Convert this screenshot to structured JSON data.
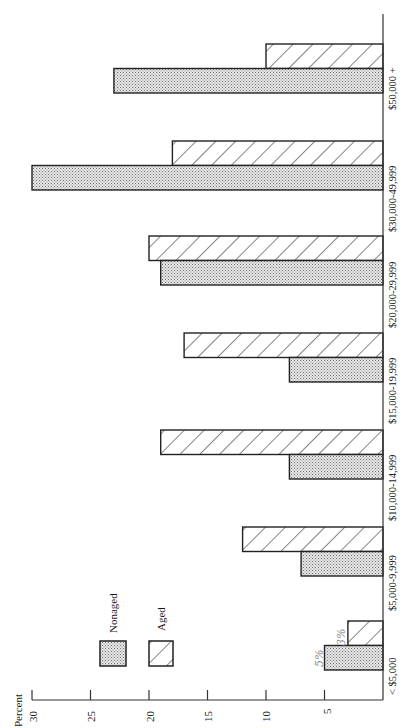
{
  "chart_data": {
    "type": "bar",
    "orientation": "rotated page; bars extend leftward from baseline (horizontal value axis at bottom)",
    "title": "",
    "xlabel": "",
    "ylabel": "Percent",
    "ylim": [
      0,
      30
    ],
    "yticks": [
      5,
      10,
      15,
      20,
      25,
      30
    ],
    "grid": false,
    "legend_position": "lower-left (rotated)",
    "categories": [
      "< $5,000",
      "$5,000-9,999",
      "$10,000-14,999",
      "$15,000-19,999",
      "$20,000-29,999",
      "$30,000-49,999",
      "$50,000 +"
    ],
    "series": [
      {
        "name": "Nonaged",
        "pattern": "dotted",
        "values": [
          5,
          7,
          8,
          8,
          19,
          30,
          23
        ]
      },
      {
        "name": "Aged",
        "pattern": "hatched",
        "values": [
          3,
          12,
          19,
          17,
          20,
          18,
          10
        ]
      }
    ],
    "annotations": [
      {
        "text": "5%",
        "target": "Nonaged < $5,000",
        "style": "handwritten"
      },
      {
        "text": "3%",
        "target": "Aged < $5,000",
        "style": "handwritten"
      }
    ]
  },
  "axis": {
    "label": "Percent",
    "ticks": [
      "5",
      "10",
      "15",
      "20",
      "25",
      "30"
    ]
  },
  "legend": {
    "nonaged_label": "Nonaged",
    "aged_label": "Aged"
  },
  "categories": {
    "c0": "< $5,000",
    "c1": "$5,000-9,999",
    "c2": "$10,000-14,999",
    "c3": "$15,000-19,999",
    "c4": "$20,000-29,999",
    "c5": "$30,000-49,999",
    "c6": "$50,000 +"
  },
  "annotations": {
    "nonaged_small": "5%",
    "aged_small": "3%"
  }
}
